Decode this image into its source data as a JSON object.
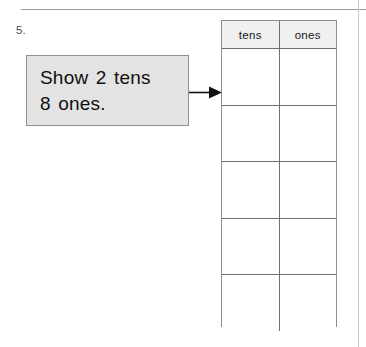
{
  "worksheet": {
    "problem_number": "5.",
    "instruction": "Show 2 tens\n8 ones."
  },
  "table": {
    "headers": [
      "tens",
      "ones"
    ],
    "rows": [
      [
        "",
        ""
      ],
      [
        "",
        ""
      ],
      [
        "",
        ""
      ],
      [
        "",
        ""
      ],
      [
        "",
        ""
      ]
    ],
    "row_count": 5,
    "column_count": 2
  },
  "arrow": {
    "label": "arrow pointing right from instruction box to table"
  },
  "colors": {
    "callout_fill": "#e3e3e3",
    "callout_border": "#8f8f8f",
    "table_header_fill": "#f0f0f0",
    "table_border": "#6f6f6f",
    "page_background": "#ffffff",
    "text": "#101010"
  }
}
